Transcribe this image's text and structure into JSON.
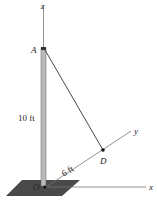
{
  "diagram": {
    "axes": {
      "z": "z",
      "y": "y",
      "x": "x"
    },
    "points": {
      "A": "A",
      "D": "D",
      "O": "O"
    },
    "dimensions": {
      "pole_height": "10 ft",
      "od_distance": "6 ft"
    },
    "colors": {
      "pole_fill": "#b9b9b9",
      "pole_edge": "#555555",
      "base_plate": "#4a4a4a",
      "axis_line": "#777777",
      "cable": "#333333"
    }
  }
}
